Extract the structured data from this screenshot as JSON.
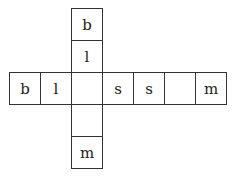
{
  "puzzle": {
    "type": "crossword-grid",
    "vertical_column": [
      {
        "letter": "b"
      },
      {
        "letter": "l"
      },
      {
        "letter": ""
      },
      {
        "letter": ""
      },
      {
        "letter": "m"
      }
    ],
    "horizontal_row": [
      {
        "letter": "b"
      },
      {
        "letter": "l"
      },
      {
        "letter": ""
      },
      {
        "letter": "s"
      },
      {
        "letter": "s"
      },
      {
        "letter": ""
      },
      {
        "letter": "m"
      }
    ],
    "intersection": {
      "row_index": 2,
      "col_index": 2
    }
  }
}
